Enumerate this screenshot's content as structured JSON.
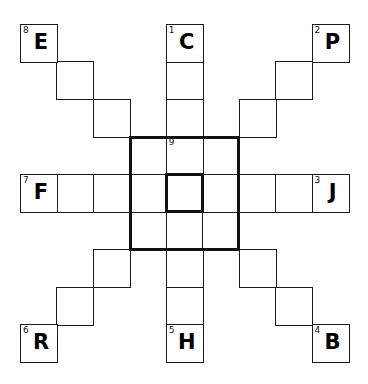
{
  "puzzle": {
    "title": "",
    "grid": {
      "rows": 9,
      "cols": 9
    },
    "clues": [
      {
        "number": "1",
        "letter": "C",
        "row": 0,
        "col": 4
      },
      {
        "number": "2",
        "letter": "P",
        "row": 0,
        "col": 8
      },
      {
        "number": "3",
        "letter": "J",
        "row": 4,
        "col": 8
      },
      {
        "number": "4",
        "letter": "B",
        "row": 8,
        "col": 8
      },
      {
        "number": "5",
        "letter": "H",
        "row": 8,
        "col": 4
      },
      {
        "number": "6",
        "letter": "R",
        "row": 8,
        "col": 0
      },
      {
        "number": "7",
        "letter": "F",
        "row": 4,
        "col": 0
      },
      {
        "number": "8",
        "letter": "E",
        "row": 0,
        "col": 0
      },
      {
        "number": "9",
        "letter": "",
        "row": 3,
        "col": 4
      }
    ],
    "empty_cells": [
      [
        1,
        1
      ],
      [
        2,
        2
      ],
      [
        3,
        3
      ],
      [
        1,
        4
      ],
      [
        2,
        4
      ],
      [
        1,
        7
      ],
      [
        2,
        6
      ],
      [
        3,
        5
      ],
      [
        4,
        1
      ],
      [
        4,
        2
      ],
      [
        4,
        3
      ],
      [
        4,
        4
      ],
      [
        4,
        5
      ],
      [
        4,
        6
      ],
      [
        4,
        7
      ],
      [
        5,
        3
      ],
      [
        6,
        2
      ],
      [
        7,
        1
      ],
      [
        5,
        4
      ],
      [
        6,
        4
      ],
      [
        7,
        4
      ],
      [
        5,
        5
      ],
      [
        6,
        6
      ],
      [
        7,
        7
      ]
    ],
    "thick_boxes": [
      {
        "name": "outer-3x3",
        "row": 3,
        "col": 3,
        "size": 3
      },
      {
        "name": "center-cell",
        "row": 4,
        "col": 4,
        "size": 1
      }
    ]
  }
}
